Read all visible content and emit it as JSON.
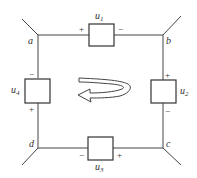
{
  "diagram": {
    "type": "circuit-loop",
    "nodes": [
      {
        "id": "a",
        "label": "a"
      },
      {
        "id": "b",
        "label": "b"
      },
      {
        "id": "c",
        "label": "c"
      },
      {
        "id": "d",
        "label": "d"
      }
    ],
    "elements": [
      {
        "id": "u1",
        "name": "u",
        "sub": "1",
        "between": "a-b",
        "plus": "+",
        "minus": "−"
      },
      {
        "id": "u2",
        "name": "u",
        "sub": "2",
        "between": "b-c",
        "plus": "+",
        "minus": "−"
      },
      {
        "id": "u3",
        "name": "u",
        "sub": "3",
        "between": "c-d",
        "plus": "+",
        "minus": "−"
      },
      {
        "id": "u4",
        "name": "u",
        "sub": "4",
        "between": "d-a",
        "plus": "+",
        "minus": "−"
      }
    ],
    "loop_direction": "counterclockwise"
  }
}
